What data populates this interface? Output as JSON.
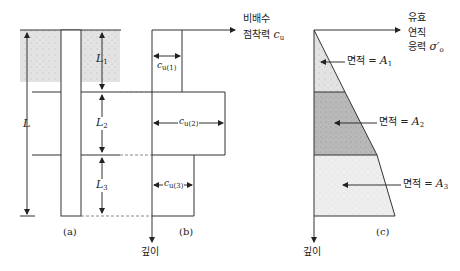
{
  "panels": {
    "a": {
      "caption": "(a)",
      "total_length_label": "L",
      "layers": [
        {
          "label": "L",
          "sub": "1"
        },
        {
          "label": "L",
          "sub": "2"
        },
        {
          "label": "L",
          "sub": "3"
        }
      ]
    },
    "b": {
      "caption": "(b)",
      "x_axis_label_line1": "비배수",
      "x_axis_label_line2": "점착력",
      "x_axis_symbol": "c",
      "x_axis_symbol_sub": "u",
      "y_axis_label": "깊이",
      "cohesion": [
        {
          "symbol": "c",
          "sub": "u(1)"
        },
        {
          "symbol": "c",
          "sub": "u(2)"
        },
        {
          "symbol": "c",
          "sub": "u(3)"
        }
      ]
    },
    "c": {
      "caption": "(c)",
      "x_axis_label_line1": "유효",
      "x_axis_label_line2": "연직",
      "x_axis_label_line3": "응력",
      "x_axis_symbol": "σ′",
      "x_axis_symbol_sub": "o",
      "y_axis_label": "깊이",
      "areas": [
        {
          "text": "면적 = ",
          "symbol": "A",
          "sub": "1"
        },
        {
          "text": "면적 = ",
          "symbol": "A",
          "sub": "2"
        },
        {
          "text": "면적 = ",
          "symbol": "A",
          "sub": "3"
        }
      ]
    }
  },
  "colors": {
    "line": "#333333",
    "soil_light": "#e2e2e2",
    "area1": "#d4d4d4",
    "area2": "#b5b5b5",
    "area3": "#ececec",
    "dash": "#888888"
  }
}
